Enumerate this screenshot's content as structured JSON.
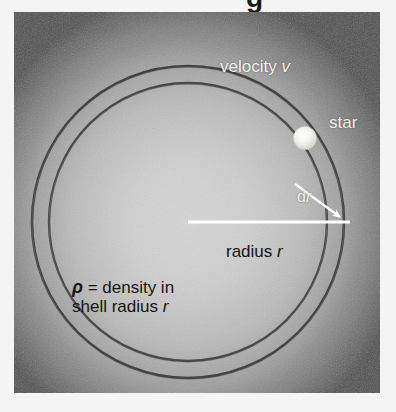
{
  "figure": {
    "kind": "astronomy-diagram",
    "title_fragment": "g",
    "panel": {
      "background_color": "#4a4a4a",
      "page_color": "#f4f4f4"
    },
    "labels": {
      "velocity": {
        "text": "velocity ",
        "symbol": "v",
        "color": "#f2f2f2"
      },
      "star": {
        "text": "star",
        "color": "#f2f2f2"
      },
      "dr": {
        "text": "d",
        "symbol": "r",
        "color": "#f2f2f2"
      },
      "radius": {
        "text": "radius ",
        "symbol": "r",
        "color": "#141414"
      },
      "density": {
        "symbol": "ρ",
        "line1": " = density in",
        "line2_prefix": "shell radius ",
        "line2_symbol": "r",
        "color": "#141414"
      }
    },
    "elements": {
      "shell_outer_radius": 156,
      "shell_inner_radius": 139,
      "center_x": 188,
      "center_y": 222,
      "radius_line_color": "#ffffff",
      "ring_color": "#3a3a3a",
      "star_color": "#f5f5f0",
      "arrow_color": "#ffffff"
    }
  }
}
